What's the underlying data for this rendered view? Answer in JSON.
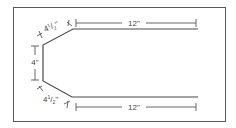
{
  "diagram": {
    "type": "dimensioned-outline",
    "labels": {
      "top_length": "12''",
      "bottom_length": "12''",
      "left_height": "4''",
      "top_diagonal_whole": "4",
      "top_diagonal_num": "1",
      "top_diagonal_den": "2",
      "top_diagonal_unit": "''",
      "bottom_diagonal_whole": "4",
      "bottom_diagonal_num": "1",
      "bottom_diagonal_den": "2",
      "bottom_diagonal_unit": "''"
    },
    "colors": {
      "line": "#4a4a4a",
      "border": "#5a5a5a",
      "background": "#ffffff"
    }
  }
}
